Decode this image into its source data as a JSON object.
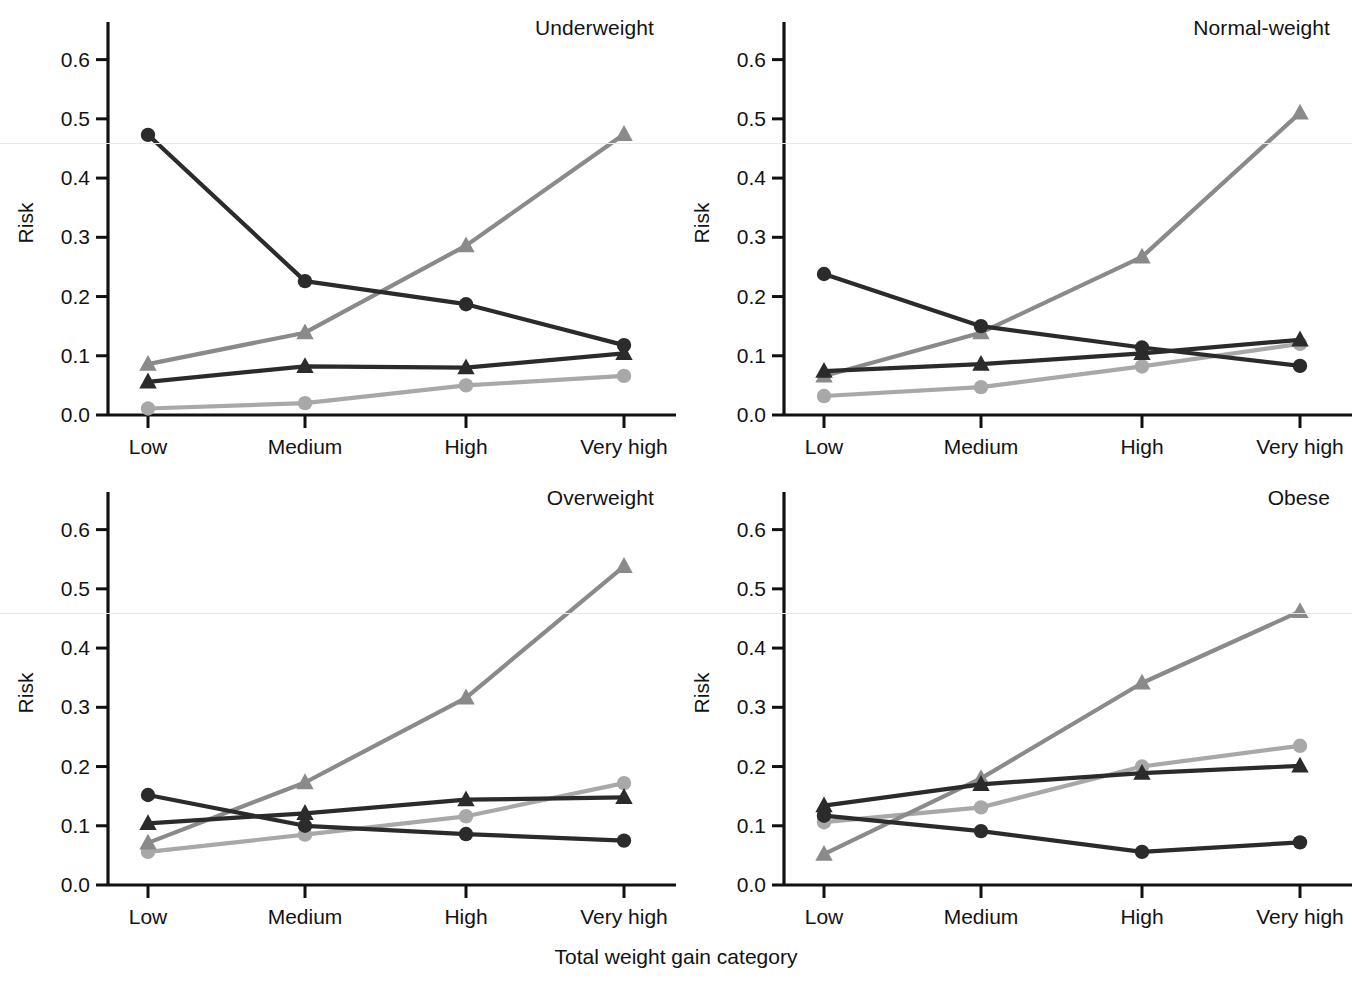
{
  "chart_data": {
    "type": "line",
    "title": "",
    "xlabel": "Total weight gain category",
    "ylabel": "Risk",
    "categories": [
      "Low",
      "Medium",
      "High",
      "Very high"
    ],
    "ytick_labels": [
      "0.0",
      "0.1",
      "0.2",
      "0.3",
      "0.4",
      "0.5",
      "0.6"
    ],
    "ytick_values": [
      0.0,
      0.1,
      0.2,
      0.3,
      0.4,
      0.5,
      0.6
    ],
    "ylim": [
      0.0,
      0.65
    ],
    "grid": false,
    "legend": "none",
    "series_styles": [
      {
        "name": "dark-circle",
        "color": "#2b2b2b",
        "marker": "circle"
      },
      {
        "name": "dark-triangle",
        "color": "#2b2b2b",
        "marker": "triangle"
      },
      {
        "name": "gray-triangle",
        "color": "#8a8a8a",
        "marker": "triangle"
      },
      {
        "name": "gray-circle",
        "color": "#a8a8a8",
        "marker": "circle"
      }
    ],
    "panels": [
      {
        "id": "underweight",
        "title": "Underweight",
        "series": [
          {
            "name": "dark-circle",
            "color": "#2b2b2b",
            "marker": "circle",
            "values": [
              0.473,
              0.226,
              0.187,
              0.118
            ]
          },
          {
            "name": "dark-triangle",
            "color": "#2b2b2b",
            "marker": "triangle",
            "values": [
              0.056,
              0.082,
              0.08,
              0.104
            ]
          },
          {
            "name": "gray-triangle",
            "color": "#8a8a8a",
            "marker": "triangle",
            "values": [
              0.086,
              0.139,
              0.286,
              0.474
            ]
          },
          {
            "name": "gray-circle",
            "color": "#a8a8a8",
            "marker": "circle",
            "values": [
              0.011,
              0.02,
              0.05,
              0.066
            ]
          }
        ]
      },
      {
        "id": "normal-weight",
        "title": "Normal-weight",
        "series": [
          {
            "name": "dark-circle",
            "color": "#2b2b2b",
            "marker": "circle",
            "values": [
              0.238,
              0.15,
              0.114,
              0.083
            ]
          },
          {
            "name": "dark-triangle",
            "color": "#2b2b2b",
            "marker": "triangle",
            "values": [
              0.074,
              0.086,
              0.104,
              0.127
            ]
          },
          {
            "name": "gray-triangle",
            "color": "#8a8a8a",
            "marker": "triangle",
            "values": [
              0.066,
              0.139,
              0.267,
              0.51
            ]
          },
          {
            "name": "gray-circle",
            "color": "#a8a8a8",
            "marker": "circle",
            "values": [
              0.032,
              0.047,
              0.082,
              0.12
            ]
          }
        ]
      },
      {
        "id": "overweight",
        "title": "Overweight",
        "series": [
          {
            "name": "dark-circle",
            "color": "#2b2b2b",
            "marker": "circle",
            "values": [
              0.152,
              0.1,
              0.086,
              0.075
            ]
          },
          {
            "name": "dark-triangle",
            "color": "#2b2b2b",
            "marker": "triangle",
            "values": [
              0.104,
              0.121,
              0.144,
              0.148
            ]
          },
          {
            "name": "gray-triangle",
            "color": "#8a8a8a",
            "marker": "triangle",
            "values": [
              0.071,
              0.173,
              0.316,
              0.538
            ]
          },
          {
            "name": "gray-circle",
            "color": "#a8a8a8",
            "marker": "circle",
            "values": [
              0.056,
              0.085,
              0.116,
              0.172
            ]
          }
        ]
      },
      {
        "id": "obese",
        "title": "Obese",
        "series": [
          {
            "name": "dark-circle",
            "color": "#2b2b2b",
            "marker": "circle",
            "values": [
              0.117,
              0.091,
              0.056,
              0.072
            ]
          },
          {
            "name": "dark-triangle",
            "color": "#2b2b2b",
            "marker": "triangle",
            "values": [
              0.134,
              0.17,
              0.189,
              0.201
            ]
          },
          {
            "name": "gray-triangle",
            "color": "#8a8a8a",
            "marker": "triangle",
            "values": [
              0.052,
              0.18,
              0.341,
              0.462
            ]
          },
          {
            "name": "gray-circle",
            "color": "#a8a8a8",
            "marker": "circle",
            "values": [
              0.106,
              0.131,
              0.2,
              0.235
            ]
          }
        ]
      }
    ]
  }
}
